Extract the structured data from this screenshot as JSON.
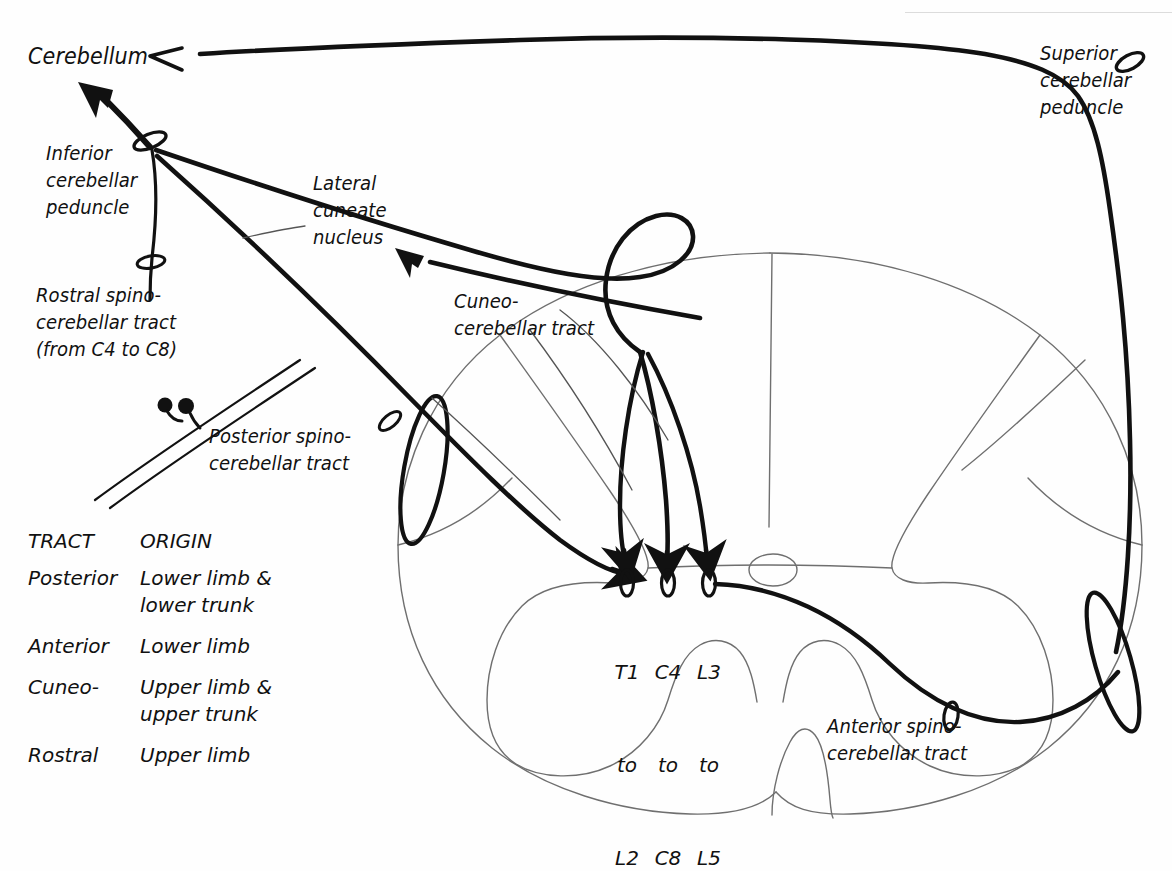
{
  "diagram": {
    "ink_color": "#111111",
    "outline_color": "#6f6f6f"
  },
  "labels": {
    "cerebellum": "Cerebellum",
    "inferior_peduncle": "Inferior\ncerebellar\npeduncle",
    "superior_peduncle": "Superior\ncerebellar\npeduncle",
    "lateral_cuneate": "Lateral\ncuneate\nnucleus",
    "rostral_tract": "Rostral spino-\ncerebellar tract\n(from C4 to C8)",
    "posterior_tract": "Posterior spino-\ncerebellar tract",
    "cuneo_tract": "Cuneo-\ncerebellar tract",
    "anterior_tract": "Anterior spino-\ncerebellar tract"
  },
  "segments": [
    {
      "name": "posterior-origin-segment",
      "line1": "T1",
      "line2": "to",
      "line3": "L2"
    },
    {
      "name": "cuneo-origin-segment",
      "line1": "C4",
      "line2": "to",
      "line3": "C8"
    },
    {
      "name": "anterior-origin-segment",
      "line1": "L3",
      "line2": "to",
      "line3": "L5"
    }
  ],
  "legend": {
    "headers": [
      "TRACT",
      "ORIGIN"
    ],
    "rows": [
      {
        "tract": "Posterior",
        "origin": "Lower limb &\nlower trunk"
      },
      {
        "tract": "Anterior",
        "origin": "Lower limb"
      },
      {
        "tract": "Cuneo-",
        "origin": "Upper limb &\nupper trunk"
      },
      {
        "tract": "Rostral",
        "origin": "Upper limb"
      }
    ]
  }
}
